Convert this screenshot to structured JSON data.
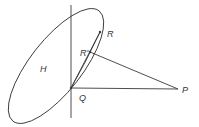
{
  "diagram": {
    "labels": {
      "H": "H",
      "R": "R",
      "R_prime": "R'",
      "Q": "Q",
      "P": "P"
    },
    "colors": {
      "stroke": "#3a3a3a",
      "background": "#ffffff"
    }
  }
}
